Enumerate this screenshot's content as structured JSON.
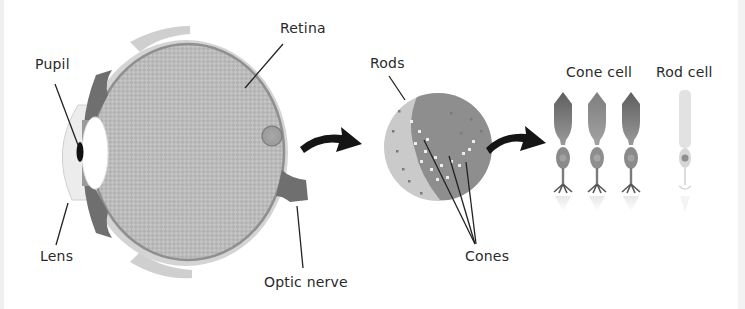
{
  "diagram": {
    "title": "",
    "colors": {
      "background": "#ffffff",
      "outline": "#7a7a7a",
      "retina_fill": "#bdbdbd",
      "iris_dark": "#6e6e6e",
      "lens_white": "#ffffff",
      "pupil": "#111111",
      "arrow": "#151515",
      "label_text": "#2a2a2a",
      "rods_light": "#c8c8c8",
      "cones_dark": "#8a8a8a",
      "cone_cell": "#7f7f7f",
      "rod_cell": "#e0e0e0"
    },
    "eye": {
      "labels": {
        "pupil": "Pupil",
        "retina": "Retina",
        "lens": "Lens",
        "optic_nerve": "Optic nerve"
      }
    },
    "retina_closeup": {
      "labels": {
        "rods": "Rods",
        "cones": "Cones"
      }
    },
    "cells": {
      "labels": {
        "cone_cell": "Cone cell",
        "rod_cell": "Rod cell"
      },
      "cone_count": 3,
      "rod_count": 1
    },
    "arrows": [
      {
        "from": "eye",
        "to": "retina_closeup"
      },
      {
        "from": "retina_closeup",
        "to": "cells"
      }
    ]
  }
}
